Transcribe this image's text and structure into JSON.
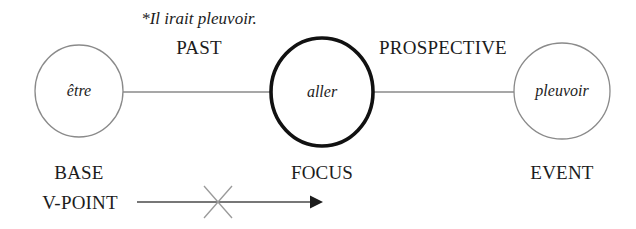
{
  "diagram": {
    "example_sentence": "*Il irait pleuvoir.",
    "nodes": [
      {
        "id": "base",
        "label": "être",
        "role_label": "BASE",
        "cx": 79,
        "cy": 91,
        "rx": 44,
        "ry": 46,
        "emphasis": "normal"
      },
      {
        "id": "focus",
        "label": "aller",
        "role_label": "FOCUS",
        "cx": 322,
        "cy": 92,
        "rx": 51,
        "ry": 54,
        "emphasis": "bold"
      },
      {
        "id": "event",
        "label": "pleuvoir",
        "role_label": "EVENT",
        "cx": 562,
        "cy": 91,
        "rx": 48,
        "ry": 48,
        "emphasis": "normal"
      }
    ],
    "relations": [
      {
        "id": "past",
        "label": "PAST",
        "from": "base",
        "to": "focus",
        "label_x": 199,
        "label_y": 38
      },
      {
        "id": "prospective",
        "label": "PROSPECTIVE",
        "from": "focus",
        "to": "event",
        "label_x": 443,
        "label_y": 38
      }
    ],
    "viewpoint_arrow": {
      "label": "V-POINT",
      "blocked": true,
      "block_marker": "x-cross"
    },
    "colors": {
      "text": "#1c1c1c",
      "thin_stroke": "#8a8a8a",
      "bold_stroke": "#111111",
      "arrow_stroke": "#4a4a4a",
      "cross_stroke": "#9a9a9a",
      "background": "#ffffff"
    }
  }
}
